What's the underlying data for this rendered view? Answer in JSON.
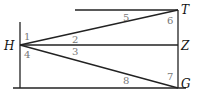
{
  "diagram": {
    "points": {
      "H": "H",
      "T": "T",
      "Z": "Z",
      "G": "G"
    },
    "angles": [
      "1",
      "2",
      "3",
      "4",
      "5",
      "6",
      "7",
      "8"
    ],
    "colors": {
      "line": "#222222",
      "point_label": "#111111",
      "angle_label": "#777777"
    }
  }
}
